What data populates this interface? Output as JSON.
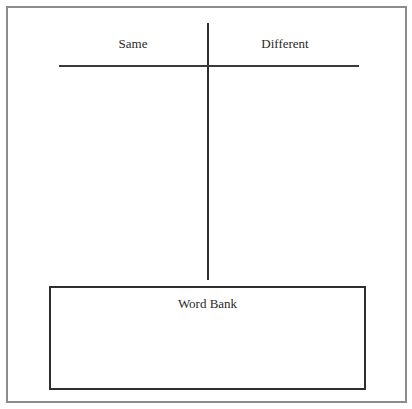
{
  "worksheet": {
    "type": "T-chart",
    "columns": [
      {
        "label": "Same"
      },
      {
        "label": "Different"
      }
    ],
    "word_bank": {
      "title": "Word Bank",
      "words": []
    },
    "colors": {
      "frame": "#8c8c8c",
      "lines": "#2e2e2e",
      "text": "#2a2a2a",
      "background": "#ffffff"
    }
  }
}
